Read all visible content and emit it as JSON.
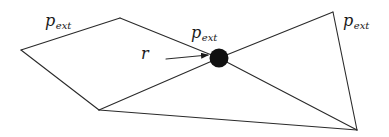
{
  "diagram": {
    "type": "graph",
    "colors": {
      "edge": "#2a2a2a",
      "node_fill": "#111111",
      "label": "#1a1a1a",
      "background": "#ffffff"
    },
    "vertices": {
      "left": {
        "x": 21,
        "y": 50
      },
      "top_left": {
        "x": 120,
        "y": 18
      },
      "bottom_left": {
        "x": 99,
        "y": 110
      },
      "top_right": {
        "x": 333,
        "y": 12
      },
      "bottom_right": {
        "x": 357,
        "y": 130
      },
      "center": {
        "x": 219,
        "y": 58
      }
    },
    "edges": [
      [
        "left",
        "top_left"
      ],
      [
        "left",
        "bottom_left"
      ],
      [
        "top_left",
        "center"
      ],
      [
        "bottom_left",
        "center"
      ],
      [
        "bottom_left",
        "bottom_right"
      ],
      [
        "center",
        "top_right"
      ],
      [
        "center",
        "bottom_right"
      ],
      [
        "top_right",
        "bottom_right"
      ]
    ],
    "node": {
      "name": "r",
      "cx": 219,
      "cy": 58,
      "radius": 9.5
    },
    "labels": [
      {
        "id": "p_ext_left",
        "main": "p",
        "sub": "ext",
        "x": 45,
        "y": 26
      },
      {
        "id": "p_ext_center",
        "main": "p",
        "sub": "ext",
        "x": 191,
        "y": 38
      },
      {
        "id": "p_ext_right",
        "main": "p",
        "sub": "ext",
        "x": 343,
        "y": 26
      },
      {
        "id": "r_label",
        "main": "r",
        "sub": "",
        "x": 141,
        "y": 59
      }
    ],
    "arrow": {
      "from": {
        "x": 166,
        "y": 59
      },
      "to": {
        "x": 208,
        "y": 55
      },
      "points_to": "node r"
    }
  }
}
